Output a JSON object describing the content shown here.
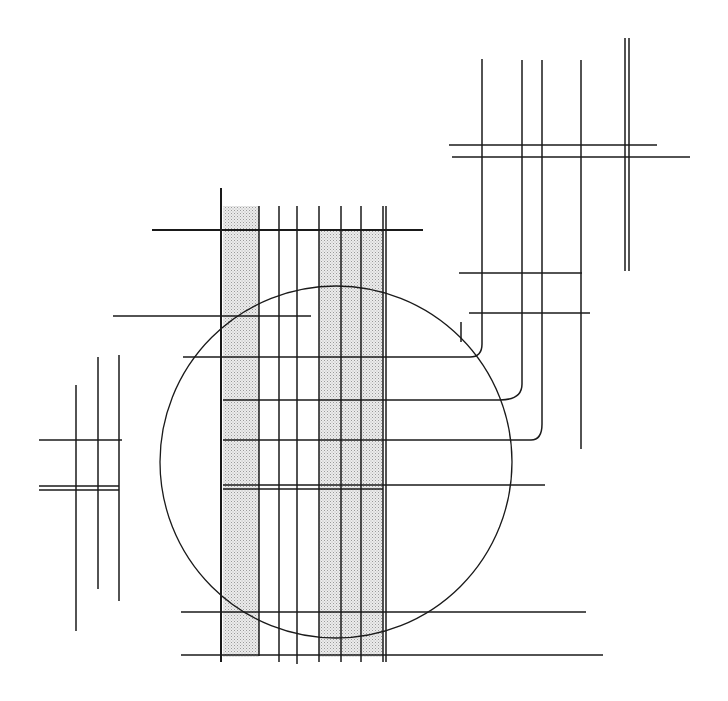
{
  "artwork": {
    "title": "",
    "background": "#ffffff",
    "stroke_color": "#1a1a1a",
    "shade_color": "#d9d9d9",
    "circle": {
      "cx": 336,
      "cy": 462,
      "r": 176
    },
    "shaded_bands": [
      {
        "x": 223,
        "y": 206,
        "w": 36,
        "h": 451
      },
      {
        "x": 319,
        "y": 230,
        "w": 64,
        "h": 427
      }
    ],
    "vertical_lines": [
      {
        "x": 221,
        "y1": 188,
        "y2": 662,
        "w": 2
      },
      {
        "x": 259,
        "y1": 206,
        "y2": 656,
        "w": 1.5
      },
      {
        "x": 279,
        "y1": 206,
        "y2": 662,
        "w": 1.5
      },
      {
        "x": 297,
        "y1": 206,
        "y2": 664,
        "w": 1.5
      },
      {
        "x": 319,
        "y1": 206,
        "y2": 662,
        "w": 1.5
      },
      {
        "x": 341,
        "y1": 206,
        "y2": 662,
        "w": 1.5
      },
      {
        "x": 361,
        "y1": 206,
        "y2": 662,
        "w": 1.5
      },
      {
        "x": 383,
        "y1": 206,
        "y2": 662,
        "w": 1.5
      },
      {
        "x": 386,
        "y1": 206,
        "y2": 662,
        "w": 1.5
      },
      {
        "x": 482,
        "y1": 59,
        "y2": 344,
        "w": 1.5
      },
      {
        "x": 522,
        "y1": 60,
        "y2": 384,
        "w": 1.5
      },
      {
        "x": 542,
        "y1": 60,
        "y2": 424,
        "w": 1.5
      },
      {
        "x": 581,
        "y1": 60,
        "y2": 449,
        "w": 1.5
      },
      {
        "x": 625,
        "y1": 38,
        "y2": 271,
        "w": 1.5
      },
      {
        "x": 629,
        "y1": 38,
        "y2": 271,
        "w": 1.5
      },
      {
        "x": 461,
        "y1": 322,
        "y2": 342,
        "w": 1.5
      },
      {
        "x": 76,
        "y1": 385,
        "y2": 631,
        "w": 1.5
      },
      {
        "x": 98,
        "y1": 357,
        "y2": 589,
        "w": 1.5
      },
      {
        "x": 119,
        "y1": 355,
        "y2": 601,
        "w": 1.5
      }
    ],
    "horizontal_lines": [
      {
        "y": 230,
        "x1": 152,
        "x2": 423,
        "w": 2
      },
      {
        "y": 316,
        "x1": 113,
        "x2": 311,
        "w": 1.5
      },
      {
        "y": 357,
        "x1": 183,
        "x2": 470,
        "w": 1.5
      },
      {
        "y": 400,
        "x1": 223,
        "x2": 500,
        "w": 1.5
      },
      {
        "y": 440,
        "x1": 223,
        "x2": 531,
        "w": 1.5
      },
      {
        "y": 485,
        "x1": 223,
        "x2": 545,
        "w": 1.5
      },
      {
        "y": 489,
        "x1": 223,
        "x2": 383,
        "w": 1.5
      },
      {
        "y": 612,
        "x1": 181,
        "x2": 586,
        "w": 1.5
      },
      {
        "y": 655,
        "x1": 181,
        "x2": 603,
        "w": 1.5
      },
      {
        "y": 145,
        "x1": 449,
        "x2": 657,
        "w": 1.5
      },
      {
        "y": 157,
        "x1": 452,
        "x2": 690,
        "w": 1.5
      },
      {
        "y": 273,
        "x1": 459,
        "x2": 582,
        "w": 1.5
      },
      {
        "y": 313,
        "x1": 469,
        "x2": 590,
        "w": 1.5
      },
      {
        "y": 440,
        "x1": 39,
        "x2": 122,
        "w": 1.5
      },
      {
        "y": 486,
        "x1": 39,
        "x2": 119,
        "w": 1.5
      },
      {
        "y": 490,
        "x1": 39,
        "x2": 119,
        "w": 1.5
      }
    ],
    "curved_connectors": [
      {
        "d": "M 470 357 Q 482 357 482 344"
      },
      {
        "d": "M 500 400 Q 522 400 522 384"
      },
      {
        "d": "M 531 440 Q 542 440 542 424"
      }
    ]
  }
}
